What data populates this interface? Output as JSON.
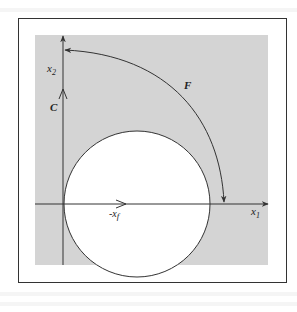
{
  "figure": {
    "frame": {
      "x": 18,
      "y": 18,
      "width": 269,
      "height": 265
    },
    "shaded_region": {
      "x": 35,
      "y": 35,
      "width": 233,
      "height": 230,
      "color": "#d4d4d4"
    },
    "axes": {
      "x1": {
        "label": "x",
        "subscript": "1",
        "y": 204,
        "x_start": 35,
        "x_end": 268
      },
      "x2": {
        "label": "x",
        "subscript": "2",
        "x": 63,
        "y_start": 265,
        "y_end": 35
      }
    },
    "circle": {
      "cx": 137,
      "cy": 204,
      "r": 73,
      "fill": "#ffffff"
    },
    "labels": {
      "C": "C",
      "F": "F",
      "neg_xf": "-x",
      "neg_xf_sub": "f"
    },
    "colors": {
      "line": "#333333",
      "background": "#ffffff",
      "shade": "#d4d4d4"
    }
  }
}
